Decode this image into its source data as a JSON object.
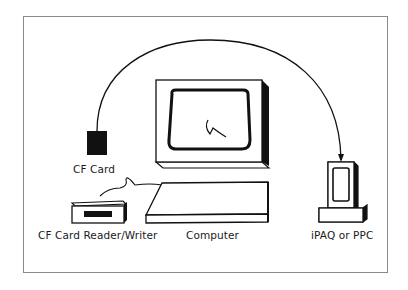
{
  "diagram": {
    "type": "data-transfer illustration",
    "nodes": [
      {
        "id": "cf_card",
        "label": "CF Card"
      },
      {
        "id": "reader",
        "label": "CF Card Reader/Writer"
      },
      {
        "id": "computer",
        "label": "Computer"
      },
      {
        "id": "ipaq",
        "label": "iPAQ or PPC"
      }
    ],
    "edges": [
      {
        "from": "cf_card",
        "to": "ipaq",
        "style": "curved arrow"
      },
      {
        "from": "reader",
        "to": "computer",
        "style": "cable"
      }
    ],
    "colors": {
      "stroke": "#111111",
      "frame": "#8a8a8a",
      "background": "#ffffff"
    }
  }
}
